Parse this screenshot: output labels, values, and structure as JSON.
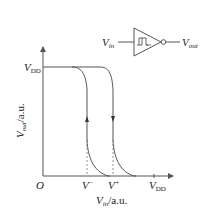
{
  "figure": {
    "type": "schmitt-trigger-inverter-hysteresis",
    "colors": {
      "line": "#555555",
      "text": "#222222",
      "dashed": "#777777",
      "background": "#ffffff"
    }
  },
  "symbol": {
    "input_label": "V",
    "input_sub": "in",
    "output_label": "V",
    "output_sub": "out"
  },
  "axes": {
    "origin_label": "O",
    "y_axis": {
      "label": "V",
      "label_sub": "out",
      "label_unit": "/a.u.",
      "tick_label": "V",
      "tick_sub": "DD"
    },
    "x_axis": {
      "label": "V",
      "label_sub": "in",
      "label_unit": "/a.u.",
      "ticks": [
        {
          "label": "V",
          "sup": "−"
        },
        {
          "label": "V",
          "sup": "+"
        },
        {
          "label": "V",
          "sub": "DD"
        }
      ]
    }
  },
  "curves": [
    {
      "name": "falling-threshold",
      "switch_at": "V−",
      "arrow_direction": "up"
    },
    {
      "name": "rising-threshold",
      "switch_at": "V+",
      "arrow_direction": "down"
    }
  ]
}
